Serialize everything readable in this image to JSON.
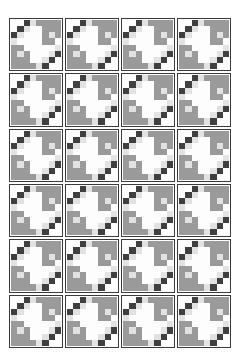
{
  "page": {
    "background_color": "#ffffff",
    "width": 240,
    "height": 360
  },
  "palette": {
    "dark": "#3f3f3f",
    "mid": "#9a9a9a",
    "light": "#e2e2e2",
    "white": "#fdfdfd",
    "border": "#3a3a3a"
  },
  "grid": {
    "columns": 4,
    "rows": 6,
    "tile_count": 24,
    "tile_label": "quilt-block"
  },
  "tile": {
    "name": "eight-by-eight-quilt-block",
    "cols": 8,
    "rows": 8,
    "cells": [
      [
        "white",
        "white",
        "dark",
        "light",
        "mid",
        "mid",
        "mid",
        "mid"
      ],
      [
        "white",
        "dark",
        "light",
        "white",
        "white",
        "mid",
        "mid",
        "mid"
      ],
      [
        "dark",
        "light",
        "white",
        "white",
        "white",
        "mid",
        "light",
        "mid"
      ],
      [
        "light",
        "white",
        "white",
        "white",
        "white",
        "mid",
        "mid",
        "white"
      ],
      [
        "mid",
        "mid",
        "white",
        "white",
        "white",
        "white",
        "white",
        "light"
      ],
      [
        "mid",
        "light",
        "mid",
        "white",
        "white",
        "white",
        "light",
        "dark"
      ],
      [
        "mid",
        "mid",
        "mid",
        "white",
        "white",
        "light",
        "dark",
        "white"
      ],
      [
        "mid",
        "mid",
        "mid",
        "mid",
        "light",
        "dark",
        "white",
        "white"
      ]
    ]
  },
  "watermark": {
    "text": ""
  }
}
